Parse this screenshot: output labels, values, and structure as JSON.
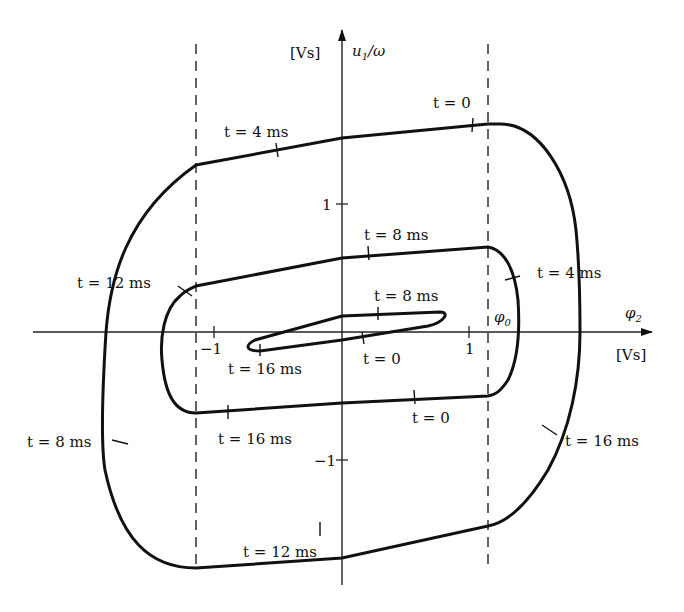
{
  "diagram": {
    "type": "phase-portrait",
    "axes": {
      "x": {
        "symbol": "φ₂",
        "unit": "[Vs]",
        "ticks": [
          "-1",
          "1"
        ]
      },
      "y": {
        "symbol": "u₁/ω",
        "unit": "[Vs]",
        "ticks": [
          "1",
          "-1"
        ]
      },
      "phi0_label": "φ₀",
      "dashed_limits": [
        "-φ₀",
        "φ₀"
      ]
    },
    "loops": [
      {
        "name": "inner",
        "labels": [
          {
            "t": "t = 8 ms"
          },
          {
            "t": "t = 0"
          },
          {
            "t": "t = 16 ms"
          }
        ]
      },
      {
        "name": "middle",
        "labels": [
          {
            "t": "t = 8 ms"
          },
          {
            "t": "t = 4 ms"
          },
          {
            "t": "t = 12 ms"
          },
          {
            "t": "t = 0"
          },
          {
            "t": "t = 16 ms"
          }
        ]
      },
      {
        "name": "outer",
        "labels": [
          {
            "t": "t = 0"
          },
          {
            "t": "t = 4 ms"
          },
          {
            "t": "t = 12 ms"
          },
          {
            "t": "t = 8 ms"
          },
          {
            "t": "t = 16 ms"
          }
        ]
      }
    ]
  },
  "text": {
    "y_unit": "[Vs]",
    "y_label": "u",
    "y_sub": "1",
    "y_rest": "/ω",
    "x_label": "φ",
    "x_sub": "2",
    "x_unit": "[Vs]",
    "phi0": "φ",
    "phi0_sub": "0",
    "tick_x_neg": "−1",
    "tick_x_pos": "1",
    "tick_y_pos": "1",
    "tick_y_neg": "−1",
    "outer_t0": "t = 0",
    "outer_t4": "t = 4 ms",
    "outer_t8": "t = 8 ms",
    "outer_t12": "t = 12 ms",
    "outer_t16": "t = 16 ms",
    "mid_t8": "t = 8 ms",
    "mid_t4": "t = 4 ms",
    "mid_t12": "t = 12 ms",
    "mid_t0": "t = 0",
    "mid_t16": "t = 16 ms",
    "in_t8": "t = 8 ms",
    "in_t0": "t = 0",
    "in_t16": "t = 16 ms"
  }
}
